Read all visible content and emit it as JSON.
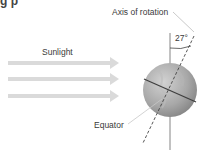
{
  "diagram": {
    "title_fragment": "g     p",
    "labels": {
      "axis": "Axis of rotation",
      "angle": "27°",
      "sunlight": "Sunlight",
      "equator": "Equator"
    },
    "sunlight_arrows": 3,
    "tilt_degrees": 27,
    "colors": {
      "arrow": "#d9d9d9",
      "sphere_light": "#c8c8c8",
      "sphere_dark": "#8a8a8a",
      "lines": "#555555",
      "leader": "#bbbbbb"
    }
  }
}
